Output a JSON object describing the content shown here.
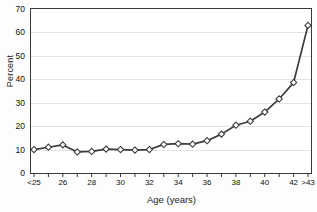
{
  "chart_data": {
    "type": "line",
    "title": "",
    "xlabel": "Age (years)",
    "ylabel": "Percent",
    "categories": [
      "<25",
      "25",
      "26",
      "27",
      "28",
      "29",
      "30",
      "31",
      "32",
      "33",
      "34",
      "35",
      "36",
      "37",
      "38",
      "39",
      "40",
      "41",
      "42",
      ">43"
    ],
    "tick_labels": [
      "<25",
      "",
      "26",
      "",
      "28",
      "",
      "30",
      "",
      "32",
      "",
      "34",
      "",
      "36",
      "",
      "38",
      "",
      "40",
      "",
      "42",
      ">43"
    ],
    "values": [
      10.0,
      11.0,
      12.0,
      9.0,
      9.2,
      10.2,
      10.0,
      9.8,
      10.0,
      12.2,
      12.5,
      12.3,
      13.8,
      16.6,
      20.4,
      22.1,
      26.0,
      31.6,
      38.6,
      63.0
    ],
    "values_extra": [
      41.5
    ],
    "ylim": [
      0,
      70
    ],
    "yticks": [
      0,
      10,
      20,
      30,
      40,
      50,
      60,
      70
    ],
    "grid": "horizontal",
    "legend": "none",
    "marker": "diamond-open",
    "line_color": "#3c3c3c",
    "marker_fill": "#ffffff",
    "grid_color": "#e3e3e3",
    "axis_color": "#3a3a3a"
  },
  "axis": {
    "y_title": "Percent",
    "x_title": "Age (years)"
  }
}
